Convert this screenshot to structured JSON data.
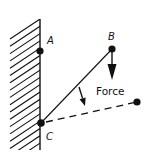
{
  "diagram": {
    "type": "statics-force-diagram",
    "colors": {
      "ink": "#111111",
      "background": "#ffffff"
    },
    "wall": {
      "x": 40,
      "y_top": 19,
      "y_bottom": 150,
      "hatch_count": 18,
      "hatch_spacing": 7.3
    },
    "points": [
      {
        "id": "A",
        "label": "A",
        "x": 40,
        "y": 51,
        "label_x": 47,
        "label_y": 44
      },
      {
        "id": "B",
        "label": "B",
        "x": 112,
        "y": 49,
        "label_x": 108,
        "label_y": 40
      },
      {
        "id": "C",
        "label": "C",
        "x": 41,
        "y": 123,
        "label_x": 46,
        "label_y": 140
      },
      {
        "id": "D",
        "label": "",
        "x": 137,
        "y": 102
      }
    ],
    "rod": {
      "from": "C",
      "to": "B",
      "style": "solid"
    },
    "dashed_line": {
      "from": "C",
      "to": "D",
      "style": "dashed"
    },
    "force_arrow": {
      "x": 112,
      "y_start": 49,
      "y_end": 80,
      "direction": "down"
    },
    "force_label": {
      "text": "Force",
      "x": 96,
      "y": 95
    },
    "rotation_arrow": {
      "x1": 79,
      "y1": 87,
      "x2": 85,
      "y2": 106,
      "meaning": "rod rotates toward dashed position"
    }
  }
}
